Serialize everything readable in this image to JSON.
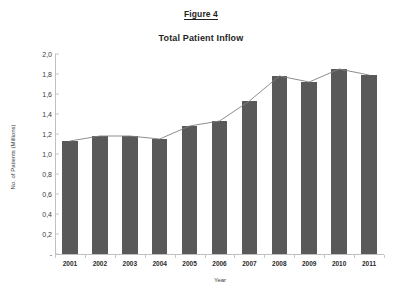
{
  "figure": {
    "label": "Figure 4",
    "title": "Total Patient Inflow"
  },
  "axes": {
    "xlabel": "Year",
    "ylabel": "No. of Patients (Millions)",
    "y_tick_labels": [
      "2,0",
      "1,8",
      "1,6",
      "1,4",
      "1,2",
      "1,0",
      "0,8",
      "0,6",
      "0,4",
      "0,2",
      "-"
    ],
    "y_tick_values": [
      2.0,
      1.8,
      1.6,
      1.4,
      1.2,
      1.0,
      0.8,
      0.6,
      0.4,
      0.2,
      0.0
    ]
  },
  "colors": {
    "bar": "#595959",
    "line": "#808080",
    "axis": "#c0c0c0",
    "text": "#2b2b2b",
    "background": "#ffffff"
  },
  "chart_data": {
    "type": "bar",
    "title": "Total Patient Inflow",
    "xlabel": "Year",
    "ylabel": "No. of Patients (Millions)",
    "categories": [
      "2001",
      "2002",
      "2003",
      "2004",
      "2005",
      "2006",
      "2007",
      "2008",
      "2009",
      "2010",
      "2011"
    ],
    "values": [
      1.13,
      1.18,
      1.18,
      1.15,
      1.28,
      1.33,
      1.53,
      1.78,
      1.72,
      1.85,
      1.79
    ],
    "series": [
      {
        "name": "Total Patient Inflow (bars)",
        "type": "bar",
        "values": [
          1.13,
          1.18,
          1.18,
          1.15,
          1.28,
          1.33,
          1.53,
          1.78,
          1.72,
          1.85,
          1.79
        ]
      },
      {
        "name": "Trend line overlay",
        "type": "line",
        "values": [
          1.13,
          1.18,
          1.18,
          1.15,
          1.28,
          1.33,
          1.53,
          1.78,
          1.72,
          1.85,
          1.79
        ]
      }
    ],
    "ylim": [
      0.0,
      2.0
    ],
    "ytick_step": 0.2,
    "grid": false,
    "legend": false,
    "decimal_separator": ","
  }
}
